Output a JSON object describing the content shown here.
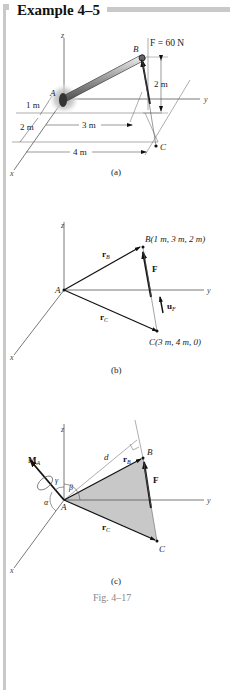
{
  "header": {
    "title": "Example 4–5"
  },
  "figure_a": {
    "axis_z": "z",
    "axis_y": "y",
    "axis_x": "x",
    "point_a": "A",
    "point_b": "B",
    "point_c": "C",
    "force_label": "F = 60 N",
    "dim_height": "2 m",
    "dim_1m": "1 m",
    "dim_2m": "2 m",
    "dim_3m": "3 m",
    "dim_4m": "4 m",
    "caption": "(a)"
  },
  "figure_b": {
    "axis_z": "z",
    "axis_y": "y",
    "axis_x": "x",
    "point_a": "A",
    "point_b": "B(1 m, 3 m, 2 m)",
    "point_c": "C(3 m, 4 m, 0)",
    "vec_rb": "r",
    "vec_rb_sub": "B",
    "vec_rc": "r",
    "vec_rc_sub": "C",
    "vec_f": "F",
    "vec_uf": "u",
    "vec_uf_sub": "F",
    "caption": "(b)"
  },
  "figure_c": {
    "axis_z": "z",
    "axis_y": "y",
    "axis_x": "x",
    "point_a": "A",
    "point_b": "B",
    "point_c": "C",
    "moment": "M",
    "moment_sub": "A",
    "alpha": "α",
    "beta": "β",
    "gamma": "γ",
    "dist_d": "d",
    "vec_rb": "r",
    "vec_rb_sub": "B",
    "vec_rc": "r",
    "vec_rc_sub": "C",
    "vec_f": "F",
    "caption": "(c)"
  },
  "figure_caption": "Fig. 4–17",
  "colors": {
    "rule": "#c9c9c9",
    "shade": "#c8c8c8",
    "caption_gray": "#888888"
  }
}
